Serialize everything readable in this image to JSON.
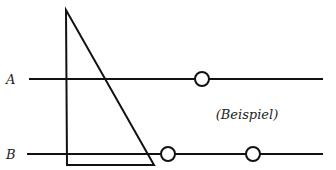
{
  "diagram": {
    "labels": {
      "line_a": "A",
      "line_b": "B",
      "note": "(Beispiel)"
    },
    "colors": {
      "stroke": "#111111",
      "background": "#ffffff"
    },
    "lines": [
      {
        "name": "A",
        "y": 79,
        "x1": 29,
        "x2": 323
      },
      {
        "name": "B",
        "y": 154,
        "x1": 27,
        "x2": 323
      }
    ],
    "triangle": {
      "apex": [
        66,
        10
      ],
      "bottom_left": [
        67,
        165
      ],
      "bottom_right": [
        154,
        165
      ]
    },
    "circles": [
      {
        "line": "A",
        "cx": 202,
        "cy": 79,
        "r": 7
      },
      {
        "line": "B",
        "cx": 168,
        "cy": 154,
        "r": 7
      },
      {
        "line": "B",
        "cx": 253,
        "cy": 154,
        "r": 7
      }
    ]
  }
}
